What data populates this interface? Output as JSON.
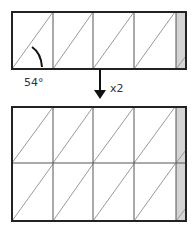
{
  "diagram": {
    "angle_label": "54°",
    "multiplier_label": "x2",
    "colors": {
      "stroke": "#222222",
      "diagonal": "#9a9a9a",
      "shade": "#d4d4d4"
    },
    "top_panel": {
      "columns": 4,
      "rows": 1,
      "shaded_strip": true
    },
    "bottom_panel": {
      "columns": 4,
      "rows": 2,
      "shaded_strip": true
    }
  }
}
